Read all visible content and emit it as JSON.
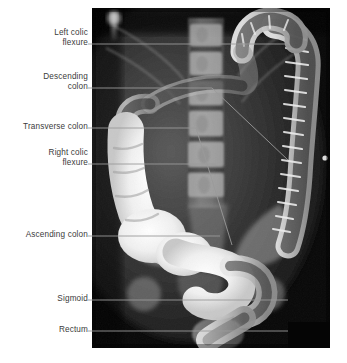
{
  "figure": {
    "kind": "labeled-radiograph",
    "modality": "double-contrast barium enema",
    "background_color": "#ffffff",
    "label_color": "#3b3b3b",
    "leader_color": "#9a9a9a",
    "plate": {
      "x": 92,
      "y": 8,
      "width": 238,
      "height": 340,
      "redaction_block": {
        "x": 288,
        "y": 322,
        "width": 42,
        "height": 26,
        "color": "#050505"
      }
    }
  },
  "labels": [
    {
      "id": "left-colic-flexure",
      "text": "Left colic\nflexure",
      "box": {
        "left": 0,
        "top": 28,
        "width": 88
      },
      "leader": "M88,44 H285"
    },
    {
      "id": "descending-colon",
      "text": "Descending\ncolon",
      "box": {
        "left": 0,
        "top": 72,
        "width": 88
      },
      "leader": "M88,88 H212 L288,160"
    },
    {
      "id": "transverse-colon",
      "text": "Transverse colon",
      "box": {
        "left": 0,
        "top": 122,
        "width": 88
      },
      "leader": "M88,128 H196 L232,245"
    },
    {
      "id": "right-colic-flexure",
      "text": "Right colic\nflexure",
      "box": {
        "left": 0,
        "top": 148,
        "width": 88
      },
      "leader": "M88,164 H216"
    },
    {
      "id": "ascending-colon",
      "text": "Ascending colon",
      "box": {
        "left": 0,
        "top": 230,
        "width": 88
      },
      "leader": "M88,236 H220"
    },
    {
      "id": "sigmoid",
      "text": "Sigmoid",
      "box": {
        "left": 0,
        "top": 294,
        "width": 88
      },
      "leader": "M88,300 H288"
    },
    {
      "id": "rectum",
      "text": "Rectum",
      "box": {
        "left": 0,
        "top": 325,
        "width": 88
      },
      "leader": "M88,331 H288"
    }
  ]
}
